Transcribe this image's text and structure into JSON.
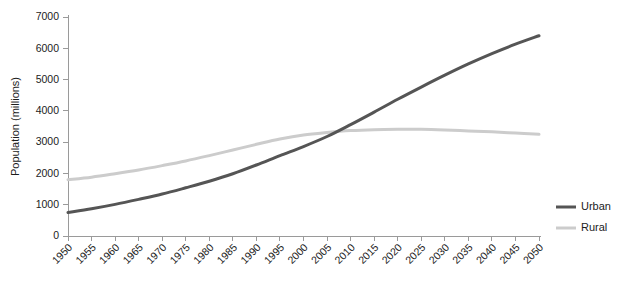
{
  "chart_data": {
    "type": "line",
    "title": "",
    "xlabel": "",
    "ylabel": "Population (millions)",
    "ylim": [
      0,
      7000
    ],
    "xlim": [
      1950,
      2050
    ],
    "grid": false,
    "legend_position": "right",
    "yticks": [
      0,
      1000,
      2000,
      3000,
      4000,
      5000,
      6000,
      7000
    ],
    "ytick_labels": [
      "0",
      "1000",
      "2000",
      "3000",
      "4000",
      "5000",
      "6000",
      "7000"
    ],
    "x": [
      1950,
      1955,
      1960,
      1965,
      1970,
      1975,
      1980,
      1985,
      1990,
      1995,
      2000,
      2005,
      2010,
      2015,
      2020,
      2025,
      2030,
      2035,
      2040,
      2045,
      2050
    ],
    "categories": [
      "1950",
      "1955",
      "1960",
      "1965",
      "1970",
      "1975",
      "1980",
      "1985",
      "1990",
      "1995",
      "2000",
      "2005",
      "2010",
      "2015",
      "2020",
      "2025",
      "2030",
      "2035",
      "2040",
      "2045",
      "2050"
    ],
    "series": [
      {
        "name": "Urban",
        "color": "#555555",
        "values": [
          750,
          870,
          1010,
          1170,
          1340,
          1540,
          1750,
          1990,
          2270,
          2570,
          2860,
          3180,
          3560,
          3960,
          4370,
          4760,
          5140,
          5500,
          5830,
          6130,
          6400
        ]
      },
      {
        "name": "Rural",
        "color": "#cccccc",
        "values": [
          1800,
          1880,
          1990,
          2110,
          2250,
          2400,
          2570,
          2750,
          2930,
          3100,
          3230,
          3310,
          3370,
          3400,
          3410,
          3410,
          3390,
          3360,
          3330,
          3290,
          3250
        ]
      }
    ],
    "annotations": {
      "crossover_year": 2008,
      "crossover_value": 3300
    }
  },
  "legend": {
    "items": [
      {
        "label": "Urban",
        "color": "#555555"
      },
      {
        "label": "Rural",
        "color": "#cccccc"
      }
    ]
  },
  "axes": {
    "y_title": "Population (millions)"
  }
}
